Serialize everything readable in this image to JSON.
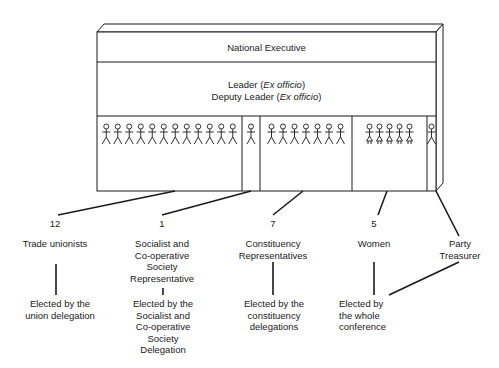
{
  "box": {
    "title": "National Executive",
    "leader": {
      "text": "Leader (",
      "italic": "Ex officio",
      "close": ")"
    },
    "deputy": {
      "text": "Deputy Leader (",
      "italic": "Ex officio",
      "close": ")"
    }
  },
  "groups": [
    {
      "id": "trade-unionists",
      "count": "12",
      "figures": 12,
      "figure_type": "man",
      "label": "Trade unionists",
      "elected": "Elected by the\nunion delegation"
    },
    {
      "id": "socialist-cooperative",
      "count": "1",
      "figures": 1,
      "figure_type": "man",
      "label": "Socialist and\nCo-operative\nSociety\nRepresentative",
      "elected": "Elected by the\nSocialist and\nCo-operative\nSociety\nDelegation"
    },
    {
      "id": "constituency",
      "count": "7",
      "figures": 7,
      "figure_type": "man",
      "label": "Constituency\nRepresentatives",
      "elected": "Elected by the\nconstituency\ndelegations"
    },
    {
      "id": "women",
      "count": "5",
      "figures": 5,
      "figure_type": "woman",
      "label": "Women",
      "elected": "Elected by\nthe whole\nconference"
    },
    {
      "id": "treasurer",
      "count": "",
      "figures": 1,
      "figure_type": "man",
      "label": "Party\nTreasurer",
      "elected": ""
    }
  ],
  "colors": {
    "line": "#1a1a1a",
    "background": "#ffffff"
  }
}
